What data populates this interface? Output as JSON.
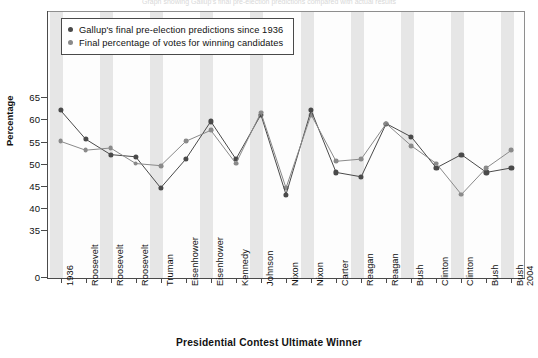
{
  "top_caption": "Graph showing Gallup's final pre-election predictions compared with actual results",
  "legend": {
    "items": [
      {
        "label": "Gallup's final pre-election predictions since 1936",
        "color": "#4a4a4a",
        "marker": "round-dot"
      },
      {
        "label": "Final percentage of votes for winning candidates",
        "color": "#8a8a8a",
        "marker": "round-dot"
      }
    ]
  },
  "axes": {
    "y_title": "Percentage",
    "x_title": "Presidential Contest Ultimate Winner",
    "y_ticks": [
      "0",
      "35",
      "40",
      "45",
      "50",
      "55",
      "60",
      "65"
    ]
  },
  "chart_data": {
    "type": "line",
    "title": "",
    "subtitle": "",
    "xlabel": "Presidential Contest Ultimate Winner",
    "ylabel": "Percentage",
    "ylim": [
      35,
      67
    ],
    "y_axis_break": true,
    "y_tick_values": [
      0,
      35,
      40,
      45,
      50,
      55,
      60,
      65
    ],
    "grid": false,
    "legend_position": "top-left",
    "categories": [
      "1936",
      "Roosevelt",
      "Roosevelt",
      "Roosevelt",
      "Truman",
      "Eisenhower",
      "Eisenhower",
      "Kennedy",
      "Johnson",
      "Nixon",
      "Nixon",
      "Carter",
      "Reagan",
      "Reagan",
      "Bush",
      "Clinton",
      "Clinton",
      "Bush",
      "Bush 2004"
    ],
    "category_first_label": "1936",
    "category_last_label": "Bush 2004",
    "series": [
      {
        "name": "Gallup's final pre-election predictions since 1936",
        "color": "#4a4a4a",
        "values": [
          62.0,
          55.5,
          52.0,
          51.5,
          44.5,
          51.0,
          59.5,
          51.0,
          61.0,
          43.0,
          62.0,
          48.0,
          47.0,
          59.0,
          56.0,
          49.0,
          52.0,
          48.0,
          49.0
        ]
      },
      {
        "name": "Final percentage of votes for winning candidates",
        "color": "#8a8a8a",
        "values": [
          55.0,
          53.0,
          53.5,
          50.0,
          49.5,
          55.0,
          57.5,
          50.0,
          61.5,
          44.5,
          61.0,
          50.5,
          51.0,
          59.0,
          54.0,
          50.0,
          43.0,
          49.0,
          53.0
        ]
      }
    ]
  }
}
